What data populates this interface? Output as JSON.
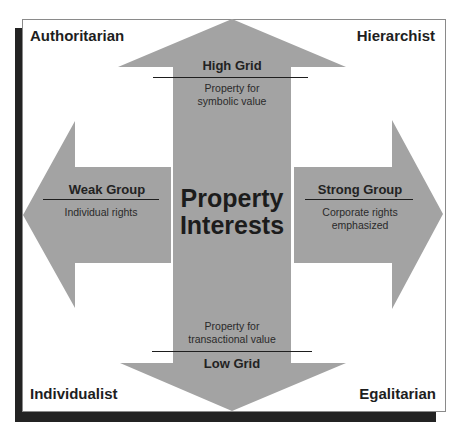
{
  "diagram": {
    "cropped_header": "Property interests",
    "center_label_line1": "Property",
    "center_label_line2": "Interests",
    "corners": {
      "top_left": "Authoritarian",
      "top_right": "Hierarchist",
      "bottom_left": "Individualist",
      "bottom_right": "Egalitarian"
    },
    "arrows": {
      "up": {
        "heading": "High Grid",
        "description_line1": "Property  for",
        "description_line2": "symbolic value"
      },
      "down": {
        "heading": "Low Grid",
        "description_line1": "Property  for",
        "description_line2": "transactional  value"
      },
      "left": {
        "heading": "Weak Group",
        "description_line1": "Individual  rights"
      },
      "right": {
        "heading": "Strong Group",
        "description_line1": "Corporate  rights",
        "description_line2": "emphasized"
      }
    },
    "colors": {
      "arrow_fill": "#a3a3a3",
      "shadow": "#232323",
      "frame_border": "#8a8a8a",
      "text": "#1e1e1e"
    }
  }
}
